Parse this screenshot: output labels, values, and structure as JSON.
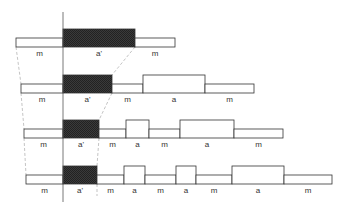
{
  "diagram": {
    "colors": {
      "stroke": "#333333",
      "hatch_fill": "#2f2f2f",
      "white_fill": "#ffffff",
      "guide": "#aaaaaa",
      "axis": "#555555"
    },
    "rows": [
      {
        "segments": [
          {
            "kind": "m",
            "label": "m"
          },
          {
            "kind": "a-prime",
            "label": "a'"
          },
          {
            "kind": "m",
            "label": "m"
          }
        ]
      },
      {
        "segments": [
          {
            "kind": "m",
            "label": "m"
          },
          {
            "kind": "a-prime",
            "label": "a'"
          },
          {
            "kind": "m",
            "label": "m"
          },
          {
            "kind": "a",
            "label": "a"
          },
          {
            "kind": "m",
            "label": "m"
          }
        ]
      },
      {
        "segments": [
          {
            "kind": "m",
            "label": "m"
          },
          {
            "kind": "a-prime",
            "label": "a'"
          },
          {
            "kind": "m",
            "label": "m"
          },
          {
            "kind": "a",
            "label": "a"
          },
          {
            "kind": "m",
            "label": "m"
          },
          {
            "kind": "a",
            "label": "a"
          },
          {
            "kind": "m",
            "label": "m"
          }
        ]
      },
      {
        "segments": [
          {
            "kind": "m",
            "label": "m"
          },
          {
            "kind": "a-prime",
            "label": "a'"
          },
          {
            "kind": "m",
            "label": "m"
          },
          {
            "kind": "a",
            "label": "a"
          },
          {
            "kind": "m",
            "label": "m"
          },
          {
            "kind": "a",
            "label": "a"
          },
          {
            "kind": "m",
            "label": "m"
          },
          {
            "kind": "a",
            "label": "a"
          },
          {
            "kind": "m",
            "label": "m"
          }
        ]
      }
    ]
  }
}
